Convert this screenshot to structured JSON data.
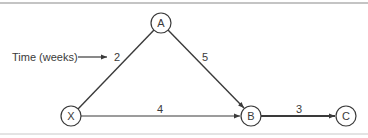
{
  "diagram": {
    "type": "network-graph",
    "annotation": {
      "label": "Time (weeks)",
      "points_to_edge": "X-A"
    },
    "nodes": [
      {
        "id": "A",
        "label": "A",
        "x": 161,
        "y": 23
      },
      {
        "id": "X",
        "label": "X",
        "x": 71,
        "y": 116
      },
      {
        "id": "B",
        "label": "B",
        "x": 251,
        "y": 116
      },
      {
        "id": "C",
        "label": "C",
        "x": 346,
        "y": 116
      }
    ],
    "edges": [
      {
        "from": "X",
        "to": "A",
        "weight": "2"
      },
      {
        "from": "A",
        "to": "B",
        "weight": "5"
      },
      {
        "from": "X",
        "to": "B",
        "weight": "4"
      },
      {
        "from": "B",
        "to": "C",
        "weight": "3"
      }
    ],
    "colors": {
      "stroke": "#3a3a3a",
      "background": "#ffffff",
      "rule": "#8a8a8a"
    }
  }
}
